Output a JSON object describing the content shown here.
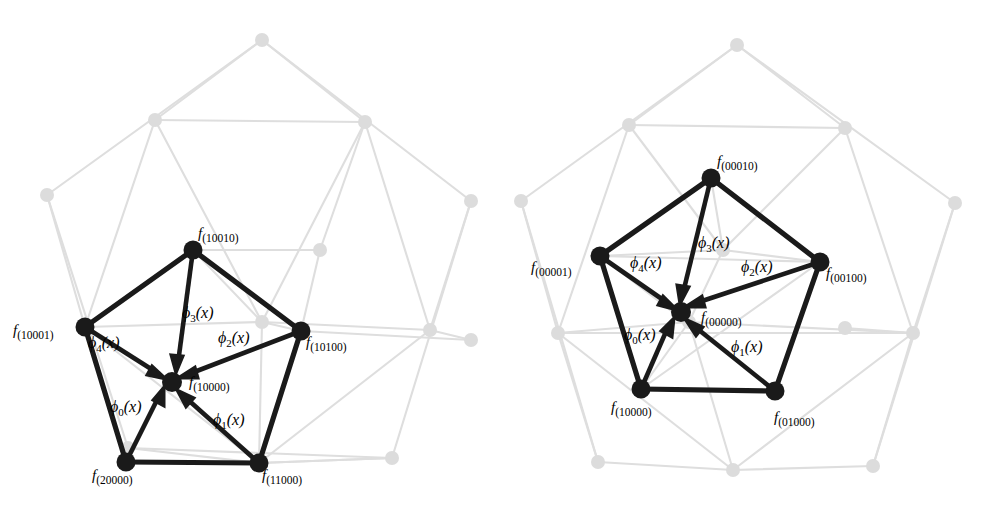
{
  "figure": {
    "title": "",
    "background_color": "#ffffff",
    "foreground_color": "#1a1a1a",
    "background_graph_color": "#dcdcdc",
    "panels": [
      {
        "id": "left",
        "name": "left-panel",
        "center_node_label": "f_(10000)",
        "center_node": {
          "f": "f",
          "sub": "(10000)"
        },
        "outer_nodes": [
          {
            "f": "f",
            "sub": "(10010)"
          },
          {
            "f": "f",
            "sub": "(10100)"
          },
          {
            "f": "f",
            "sub": "(11000)"
          },
          {
            "f": "f",
            "sub": "(20000)"
          },
          {
            "f": "f",
            "sub": "(10001)"
          }
        ],
        "arrows": [
          {
            "phi": "ϕ",
            "sub": "0",
            "arg": "(x)"
          },
          {
            "phi": "ϕ",
            "sub": "1",
            "arg": "(x)"
          },
          {
            "phi": "ϕ",
            "sub": "2",
            "arg": "(x)"
          },
          {
            "phi": "ϕ",
            "sub": "3",
            "arg": "(x)"
          },
          {
            "phi": "ϕ",
            "sub": "4",
            "arg": "(x)"
          }
        ]
      },
      {
        "id": "right",
        "name": "right-panel",
        "center_node_label": "f_(00000)",
        "center_node": {
          "f": "f",
          "sub": "(00000)"
        },
        "outer_nodes": [
          {
            "f": "f",
            "sub": "(00010)"
          },
          {
            "f": "f",
            "sub": "(00100)"
          },
          {
            "f": "f",
            "sub": "(01000)"
          },
          {
            "f": "f",
            "sub": "(10000)"
          },
          {
            "f": "f",
            "sub": "(00001)"
          }
        ],
        "arrows": [
          {
            "phi": "ϕ",
            "sub": "0",
            "arg": "(x)"
          },
          {
            "phi": "ϕ",
            "sub": "1",
            "arg": "(x)"
          },
          {
            "phi": "ϕ",
            "sub": "2",
            "arg": "(x)"
          },
          {
            "phi": "ϕ",
            "sub": "3",
            "arg": "(x)"
          },
          {
            "phi": "ϕ",
            "sub": "4",
            "arg": "(x)"
          }
        ]
      }
    ]
  }
}
